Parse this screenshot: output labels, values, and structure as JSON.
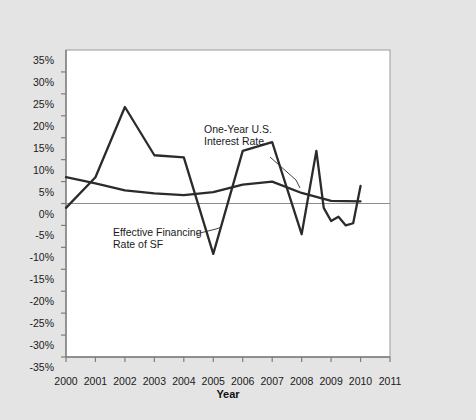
{
  "top_caption": "",
  "chart_data": {
    "type": "line",
    "title": "",
    "xlabel": "Year",
    "ylabel": "",
    "x": [
      2000,
      2001,
      2002,
      2003,
      2004,
      2005,
      2006,
      2007,
      2008,
      2009,
      2010,
      2011
    ],
    "xticklabels": [
      "2000",
      "2001",
      "2002",
      "2003",
      "2004",
      "2005",
      "2006",
      "2007",
      "2008",
      "2009",
      "2010",
      "2011"
    ],
    "yticklabels": [
      "35%",
      "30%",
      "25%",
      "20%",
      "15%",
      "10%",
      "5%",
      "0%",
      "-5%",
      "-10%",
      "-15%",
      "-20%",
      "-25%",
      "-30%",
      "-35%"
    ],
    "ytickvalues": [
      35,
      30,
      25,
      20,
      15,
      10,
      5,
      0,
      -5,
      -10,
      -15,
      -20,
      -25,
      -30,
      -35
    ],
    "ylim": [
      -35,
      35
    ],
    "xlim": [
      2000,
      2011
    ],
    "grid": false,
    "zero_line": true,
    "legend_position": "inline-annotations",
    "series": [
      {
        "name": "Effective Financing Rate of SF",
        "color": "#2b2b2b",
        "x": [
          2000,
          2001,
          2002,
          2003,
          2004,
          2005,
          2006,
          2007,
          2008,
          2008.5,
          2008.75,
          2009,
          2009.25,
          2009.5,
          2009.75,
          2010
        ],
        "values": [
          -1.0,
          6.0,
          22.0,
          11.0,
          10.5,
          -11.5,
          12.0,
          14.0,
          -7.0,
          12.0,
          -1.0,
          -4.0,
          -3.0,
          -5.0,
          -4.5,
          4.0
        ]
      },
      {
        "name": "One-Year U.S. Interest Rate",
        "color": "#2b2b2b",
        "x": [
          2000,
          2001,
          2002,
          2003,
          2004,
          2005,
          2006,
          2007,
          2008,
          2009,
          2010
        ],
        "values": [
          6.0,
          4.6,
          3.0,
          2.3,
          1.9,
          2.6,
          4.3,
          5.0,
          2.4,
          0.6,
          0.5
        ]
      }
    ],
    "annotations": [
      {
        "name": "one-year-us-interest-rate",
        "text_line1": "One-Year U.S.",
        "text_line2": "Interest Rate"
      },
      {
        "name": "effective-financing-rate-of-sf",
        "text_line1": "Effective Financing",
        "text_line2": "Rate of SF"
      }
    ]
  }
}
